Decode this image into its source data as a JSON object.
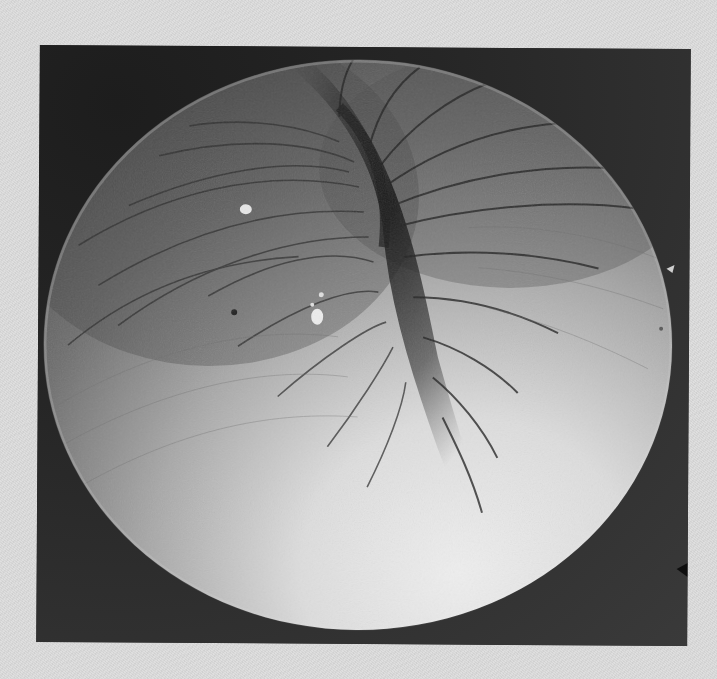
{
  "image": {
    "description": "Scanning electron micrograph of a wrinkled spherical specimen with a central invaginated fold on a dark background, printed on light grey paper",
    "colors": {
      "paper": "#dcdcdc",
      "frame_background": "#2b2b2b",
      "specimen_highlight": "#e6e6e6",
      "specimen_shadow": "#4a4a4a",
      "fold_shadow": "#1a1a1a"
    },
    "frame": {
      "x": 38,
      "y": 47,
      "width": 651,
      "height": 597
    },
    "specimen": {
      "center_x": 358,
      "center_y": 345,
      "radius_x": 314,
      "radius_y": 285
    }
  }
}
